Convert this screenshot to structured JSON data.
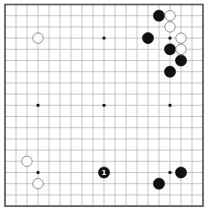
{
  "board": {
    "size": 19,
    "origin_px": {
      "x": 5,
      "y": 4.5
    },
    "spacing_px": {
      "x": 11,
      "y": 11.2
    },
    "stone_radius_px": 5.6,
    "colors": {
      "background": "#ffffff",
      "grid": "#b8b8b8",
      "border": "#555555",
      "black_stone": "#111111",
      "white_stone": "#ffffff",
      "white_stone_outline": "#777777"
    },
    "star_points": [
      {
        "col": 3,
        "row": 3
      },
      {
        "col": 9,
        "row": 3
      },
      {
        "col": 15,
        "row": 3
      },
      {
        "col": 3,
        "row": 9
      },
      {
        "col": 9,
        "row": 9
      },
      {
        "col": 15,
        "row": 9
      },
      {
        "col": 3,
        "row": 15
      },
      {
        "col": 9,
        "row": 15
      },
      {
        "col": 15,
        "row": 15
      }
    ],
    "stones": [
      {
        "color": "black",
        "col": 14,
        "row": 1,
        "label": ""
      },
      {
        "color": "white",
        "col": 15,
        "row": 1,
        "label": ""
      },
      {
        "color": "white",
        "col": 15,
        "row": 2,
        "label": ""
      },
      {
        "color": "black",
        "col": 13,
        "row": 3,
        "label": ""
      },
      {
        "color": "white",
        "col": 16,
        "row": 3,
        "label": ""
      },
      {
        "color": "black",
        "col": 15,
        "row": 4,
        "label": ""
      },
      {
        "color": "white",
        "col": 16,
        "row": 4,
        "label": ""
      },
      {
        "color": "black",
        "col": 16,
        "row": 5,
        "label": ""
      },
      {
        "color": "black",
        "col": 15,
        "row": 6,
        "label": ""
      },
      {
        "color": "white",
        "col": 3,
        "row": 3,
        "label": ""
      },
      {
        "color": "white",
        "col": 2,
        "row": 14,
        "label": ""
      },
      {
        "color": "white",
        "col": 3,
        "row": 16,
        "label": ""
      },
      {
        "color": "black",
        "col": 9,
        "row": 15,
        "label": "1"
      },
      {
        "color": "black",
        "col": 16,
        "row": 15,
        "label": ""
      },
      {
        "color": "black",
        "col": 14,
        "row": 16,
        "label": ""
      }
    ]
  }
}
